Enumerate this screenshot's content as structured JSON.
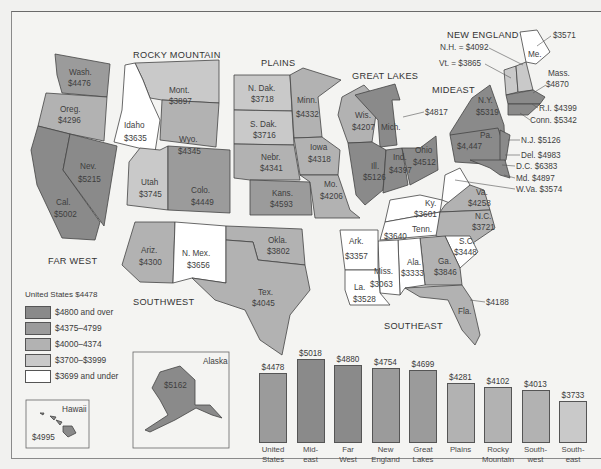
{
  "colors": {
    "c4800": "#8a8a8a",
    "c4375": "#9b9b9b",
    "c4000": "#b2b2b2",
    "c3700": "#c9c9c9",
    "c3699": "#ffffff",
    "bg": "#f4f4f2"
  },
  "regions": {
    "far_west": "FAR WEST",
    "rocky_mountain": "ROCKY MOUNTAIN",
    "plains": "PLAINS",
    "great_lakes": "GREAT LAKES",
    "new_england": "NEW ENGLAND",
    "mideast": "MIDEAST",
    "southwest": "SOUTHWEST",
    "southeast": "SOUTHEAST"
  },
  "states": {
    "wash": {
      "name": "Wash.",
      "value": "$4476"
    },
    "oreg": {
      "name": "Oreg.",
      "value": "$4296"
    },
    "nev": {
      "name": "Nev.",
      "value": "$5215"
    },
    "cal": {
      "name": "Cal.",
      "value": "$5002"
    },
    "idaho": {
      "name": "Idaho",
      "value": "$3635"
    },
    "mont": {
      "name": "Mont.",
      "value": "$3897"
    },
    "wyo": {
      "name": "Wyo.",
      "value": "$4345"
    },
    "utah": {
      "name": "Utah",
      "value": "$3745"
    },
    "colo": {
      "name": "Colo.",
      "value": "$4449"
    },
    "ndak": {
      "name": "N. Dak.",
      "value": "$3718"
    },
    "sdak": {
      "name": "S. Dak.",
      "value": "$3716"
    },
    "minn": {
      "name": "Minn.",
      "value": "$4332"
    },
    "iowa": {
      "name": "Iowa",
      "value": "$4318"
    },
    "nebr": {
      "name": "Nebr.",
      "value": "$4341"
    },
    "kans": {
      "name": "Kans.",
      "value": "$4593"
    },
    "mo": {
      "name": "Mo.",
      "value": "$4206"
    },
    "wis": {
      "name": "Wis.",
      "value": "$4207"
    },
    "mich": {
      "name": "Mich.",
      "value": "$4817"
    },
    "ill": {
      "name": "Ill.",
      "value": "$5126"
    },
    "ind": {
      "name": "Ind.",
      "value": "$4397"
    },
    "ohio": {
      "name": "Ohio",
      "value": "$4512"
    },
    "ny": {
      "name": "N.Y.",
      "value": "$5319"
    },
    "pa": {
      "name": "Pa.",
      "value": "$4,447"
    },
    "me": {
      "name": "Me.",
      "value": "$3571"
    },
    "nh": {
      "name": "N.H.",
      "label": "N.H. = $4092"
    },
    "vt": {
      "name": "Vt.",
      "label": "Vt. = $3865"
    },
    "mass": {
      "name": "Mass.",
      "value": "$4870"
    },
    "ri": {
      "label": "R.I.  $4399"
    },
    "conn": {
      "label": "Conn.  $5342"
    },
    "nj": {
      "label": "N.J.  $5126"
    },
    "del": {
      "label": "Del.  $4983"
    },
    "dc": {
      "label": "D.C.  $6383"
    },
    "md": {
      "label": "Md.  $4897"
    },
    "wva": {
      "label": "W.Va.  $3574"
    },
    "ariz": {
      "name": "Ariz.",
      "value": "$4300"
    },
    "nmex": {
      "name": "N. Mex.",
      "value": "$3656"
    },
    "okla": {
      "name": "Okla.",
      "value": "$3802"
    },
    "tex": {
      "name": "Tex.",
      "value": "$4045"
    },
    "va": {
      "name": "Va.",
      "value": "$4258"
    },
    "ky": {
      "name": "Ky.",
      "value": "$3601"
    },
    "nc": {
      "name": "N.C.",
      "value": "$3721"
    },
    "tenn": {
      "name": "Tenn.",
      "value": "$3640"
    },
    "sc": {
      "name": "S.C.",
      "value": "$3448"
    },
    "ark": {
      "name": "Ark.",
      "value": "$3357"
    },
    "ga": {
      "name": "Ga.",
      "value": "$3846"
    },
    "ala": {
      "name": "Ala.",
      "value": "$3333"
    },
    "miss": {
      "name": "Miss.",
      "value": "$3063"
    },
    "la": {
      "name": "La.",
      "value": "$3528"
    },
    "fla": {
      "name": "Fla.",
      "value": "$4188"
    },
    "alaska": {
      "name": "Alaska",
      "value": "$5162"
    },
    "hawaii": {
      "name": "Hawaii",
      "value": "$4995"
    }
  },
  "legend": {
    "title": "United States $4478",
    "items": [
      {
        "label": "$4800 and over"
      },
      {
        "label": "$4375–4799"
      },
      {
        "label": "$4000–4374"
      },
      {
        "label": "$3700–$3999"
      },
      {
        "label": "$3699 and under"
      }
    ]
  },
  "chart_data": {
    "type": "bar",
    "categories": [
      "United States",
      "Mideast",
      "Far West",
      "New England",
      "Great Lakes",
      "Plains",
      "Rocky Mountain",
      "Southwest",
      "Southeast"
    ],
    "values": [
      4478,
      5018,
      4880,
      4754,
      4699,
      4281,
      4102,
      4013,
      3733
    ],
    "value_labels": [
      "$4478",
      "$5018",
      "$4880",
      "$4754",
      "$4699",
      "$4281",
      "$4102",
      "$4013",
      "$3733"
    ],
    "category_lines": [
      [
        "United",
        "States"
      ],
      [
        "Mid-",
        "east"
      ],
      [
        "Far",
        "West"
      ],
      [
        "New",
        "England"
      ],
      [
        "Great",
        "Lakes"
      ],
      [
        "Plains",
        ""
      ],
      [
        "Rocky",
        "Mountain"
      ],
      [
        "South-",
        "west"
      ],
      [
        "South-",
        "east"
      ]
    ],
    "xlabel": "",
    "ylabel": "",
    "map_legend": [
      "$4800 and over",
      "$4375–4799",
      "$4000–4374",
      "$3700–$3999",
      "$3699 and under"
    ]
  },
  "bars": [
    {
      "value": "$4478",
      "l1": "United",
      "l2": "States",
      "h": 68
    },
    {
      "value": "$5018",
      "l1": "Mid-",
      "l2": "east",
      "h": 82
    },
    {
      "value": "$4880",
      "l1": "Far",
      "l2": "West",
      "h": 76
    },
    {
      "value": "$4754",
      "l1": "New",
      "l2": "England",
      "h": 73
    },
    {
      "value": "$4699",
      "l1": "Great",
      "l2": "Lakes",
      "h": 71
    },
    {
      "value": "$4281",
      "l1": "Plains",
      "l2": "",
      "h": 58
    },
    {
      "value": "$4102",
      "l1": "Rocky",
      "l2": "Mountain",
      "h": 54
    },
    {
      "value": "$4013",
      "l1": "South-",
      "l2": "west",
      "h": 51
    },
    {
      "value": "$3733",
      "l1": "South-",
      "l2": "east",
      "h": 40
    }
  ]
}
